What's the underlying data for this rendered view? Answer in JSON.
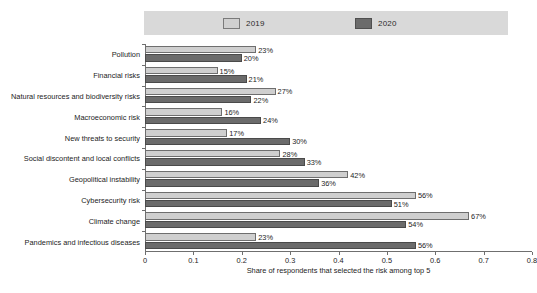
{
  "chart_data": {
    "type": "bar",
    "orientation": "horizontal",
    "title": "",
    "xlabel": "Share of respondents that selected the risk among top 5",
    "ylabel": "",
    "xlim": [
      0,
      0.8
    ],
    "xticks": [
      "0",
      "0.1",
      "0.2",
      "0.3",
      "0.4",
      "0.5",
      "0.6",
      "0.7",
      "0.8"
    ],
    "xtick_values": [
      0,
      0.1,
      0.2,
      0.3,
      0.4,
      0.5,
      0.6,
      0.7,
      0.8
    ],
    "grid": false,
    "legend_position": "top",
    "categories": [
      "Pollution",
      "Financial risks",
      "Natural resources and biodiversity risks",
      "Macroeconomic risk",
      "New threats to security",
      "Social discontent and local conflicts",
      "Geopolitical instability",
      "Cybersecurity risk",
      "Climate change",
      "Pandemics and infectious diseases"
    ],
    "series": [
      {
        "name": "2019",
        "color": "#cfcfcf",
        "values": [
          0.23,
          0.15,
          0.27,
          0.16,
          0.17,
          0.28,
          0.42,
          0.56,
          0.67,
          0.23
        ],
        "labels": [
          "23%",
          "15%",
          "27%",
          "16%",
          "17%",
          "28%",
          "42%",
          "56%",
          "67%",
          "23%"
        ]
      },
      {
        "name": "2020",
        "color": "#6b6b6b",
        "values": [
          0.2,
          0.21,
          0.22,
          0.24,
          0.3,
          0.33,
          0.36,
          0.51,
          0.54,
          0.56
        ],
        "labels": [
          "20%",
          "21%",
          "22%",
          "24%",
          "30%",
          "33%",
          "36%",
          "51%",
          "54%",
          "56%"
        ]
      }
    ]
  },
  "legend": {
    "items": [
      {
        "label": "2019",
        "color": "#cfcfcf"
      },
      {
        "label": "2020",
        "color": "#6b6b6b"
      }
    ]
  },
  "colors": {
    "series_2019": "#cfcfcf",
    "series_2020": "#6b6b6b",
    "legend_band": "#d9d9d9",
    "axis": "#6f6f6f",
    "text": "#1c1c1c"
  }
}
